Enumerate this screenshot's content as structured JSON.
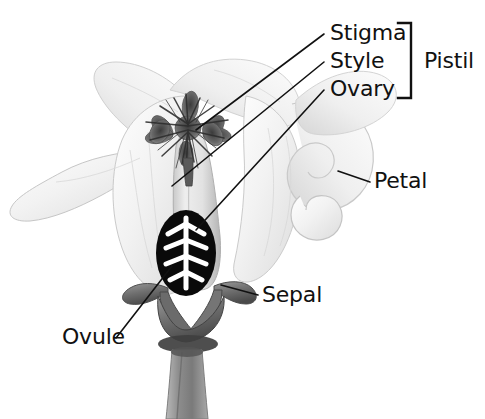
{
  "diagram": {
    "style": "grayscale-photographic-illustration",
    "background_color": "#ffffff",
    "line_color": "#111111",
    "text_color": "#111111",
    "labels": {
      "stigma": "Stigma",
      "style": "Style",
      "ovary": "Ovary",
      "pistil": "Pistil",
      "petal": "Petal",
      "sepal": "Sepal",
      "ovule": "Ovule"
    },
    "grouping": {
      "bracket_label": "Pistil",
      "bracket_members": [
        "Stigma",
        "Style",
        "Ovary"
      ]
    },
    "parts": [
      {
        "name": "stigma",
        "label": "Stigma",
        "description": "feathery dark star-shaped structure at top of style"
      },
      {
        "name": "style",
        "label": "Style",
        "description": "pale elongated column below stigma"
      },
      {
        "name": "ovary",
        "label": "Ovary",
        "description": "black ellipse enclosing ovule pattern"
      },
      {
        "name": "ovule",
        "label": "Ovule",
        "description": "white branching fishbone pattern inside ovary"
      },
      {
        "name": "petal",
        "label": "Petal",
        "description": "large pale curled petals flaring outward"
      },
      {
        "name": "sepal",
        "label": "Sepal",
        "description": "dark gray pointed leaves at base of flower"
      },
      {
        "name": "pistil",
        "label": "Pistil",
        "description": "bracketed group: stigma, style and ovary"
      },
      {
        "name": "stem",
        "label": "",
        "description": "thick gray stalk below the sepals"
      }
    ]
  }
}
